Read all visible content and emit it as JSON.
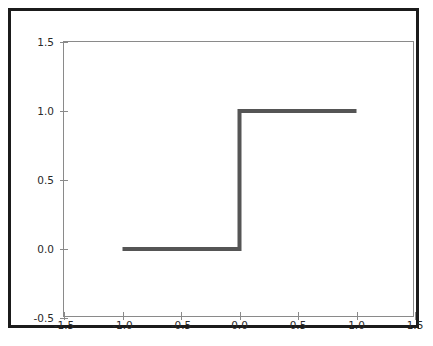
{
  "figure": {
    "width": 433,
    "height": 346,
    "background_color": "#ffffff",
    "frame_color": "#1b1b1b",
    "axes_spine_color": "#8a8a8a",
    "tick_label_color": "#2a2a2a"
  },
  "chart_data": {
    "type": "line",
    "title": "",
    "subtitle": "",
    "xlabel": "",
    "ylabel": "",
    "xlim": [
      -1.5,
      1.5
    ],
    "ylim": [
      -0.5,
      1.5
    ],
    "xticks": [
      -1.5,
      -1.0,
      -0.5,
      0.0,
      0.5,
      1.0,
      1.5
    ],
    "yticks": [
      -0.5,
      0.0,
      0.5,
      1.0,
      1.5
    ],
    "xticklabels": [
      "-1.5",
      "-1.0",
      "-0.5",
      "0.0",
      "0.5",
      "1.0",
      "1.5"
    ],
    "yticklabels": [
      "-0.5",
      "0.0",
      "0.5",
      "1.0",
      "1.5"
    ],
    "grid": false,
    "legend": null,
    "legend_position": "none",
    "annotations": [],
    "series": [
      {
        "name": "step",
        "color": "#555555",
        "linewidth": 4,
        "x": [
          -1.0,
          -0.9,
          -0.8,
          -0.7,
          -0.6,
          -0.5,
          -0.4,
          -0.3,
          -0.2,
          -0.1,
          0.0,
          0.0,
          0.1,
          0.2,
          0.3,
          0.4,
          0.5,
          0.6,
          0.7,
          0.8,
          0.9,
          1.0
        ],
        "values": [
          0.0,
          0.0,
          0.0,
          0.0,
          0.0,
          0.0,
          0.0,
          0.0,
          0.0,
          0.0,
          0.0,
          1.0,
          1.0,
          1.0,
          1.0,
          1.0,
          1.0,
          1.0,
          1.0,
          1.0,
          1.0,
          1.0
        ]
      }
    ]
  }
}
